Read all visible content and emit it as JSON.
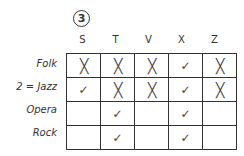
{
  "puzzle_number": "3",
  "columns": [
    "S",
    "T",
    "V",
    "X",
    "Z"
  ],
  "rows": [
    {
      "label": "Folk",
      "cells": [
        "x",
        "x",
        "x",
        "check",
        "x"
      ]
    },
    {
      "label": "2 = Jazz",
      "cells": [
        "check",
        "x",
        "x",
        "check",
        "x"
      ]
    },
    {
      "label": "Opera",
      "cells": [
        "",
        "check",
        "",
        "check",
        ""
      ]
    },
    {
      "label": "Rock",
      "cells": [
        "",
        "check",
        "",
        "check",
        ""
      ]
    }
  ],
  "symbols": {
    "x": "╳",
    "check": "✓"
  }
}
